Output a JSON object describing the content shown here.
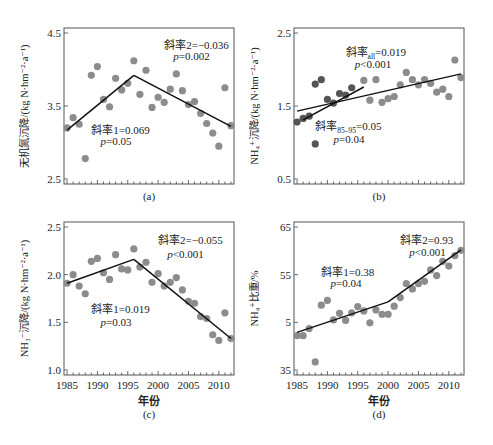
{
  "figure": {
    "x_axis_title": "年份",
    "x_ticks": [
      "1985",
      "1990",
      "1995",
      "2000",
      "2005",
      "2010"
    ]
  },
  "chart_data": [
    {
      "panel": "(a)",
      "type": "scatter",
      "ylabel": "无机氮沉降/(kg N·hm⁻²·a⁻¹)",
      "xlabel": "",
      "ylim": [
        2.5,
        4.5
      ],
      "yticks": [
        "2.5",
        "3.5",
        "4.5"
      ],
      "xlim": [
        1984.5,
        2012.5
      ],
      "grid": false,
      "point_color": "#8c8c8c",
      "x": [
        1985,
        1986,
        1987,
        1988,
        1989,
        1990,
        1991,
        1992,
        1993,
        1994,
        1995,
        1996,
        1997,
        1998,
        1999,
        2000,
        2001,
        2002,
        2003,
        2004,
        2005,
        2006,
        2007,
        2008,
        2009,
        2010,
        2011,
        2012
      ],
      "values": [
        3.2,
        3.34,
        3.25,
        2.78,
        3.92,
        4.04,
        3.59,
        3.49,
        3.88,
        3.72,
        3.81,
        4.12,
        3.66,
        3.99,
        3.48,
        3.62,
        3.55,
        3.73,
        3.94,
        3.71,
        3.52,
        3.56,
        3.4,
        3.26,
        3.13,
        2.95,
        3.75,
        3.23
      ],
      "fit_lines": [
        {
          "x": [
            1985,
            1996
          ],
          "y": [
            3.17,
            3.92
          ]
        },
        {
          "x": [
            1996,
            2012
          ],
          "y": [
            3.92,
            3.22
          ]
        }
      ],
      "annotations": [
        {
          "text": "斜率1=0.069",
          "x": 1989,
          "y": 3.12
        },
        {
          "text": "p=0.05",
          "x": 1990.5,
          "y": 2.97
        },
        {
          "text": "斜率2=−0.036",
          "x": 2001,
          "y": 4.28
        },
        {
          "text": "p=0.002",
          "x": 2002.5,
          "y": 4.13
        }
      ]
    },
    {
      "panel": "(b)",
      "type": "scatter",
      "ylabel": "NH₄⁺沉降/(kg N·hm⁻²·a⁻¹)",
      "xlabel": "",
      "ylim": [
        0.5,
        2.5
      ],
      "yticks": [
        "0.5",
        "1.5",
        "2.5"
      ],
      "xlim": [
        1984.5,
        2012.5
      ],
      "grid": false,
      "series": [
        {
          "name": "1985-1995",
          "color": "#555555",
          "x": [
            1985,
            1986,
            1987,
            1988,
            1989,
            1990,
            1991,
            1992,
            1993,
            1994,
            1995
          ],
          "values": [
            1.28,
            1.33,
            1.36,
            1.8,
            1.86,
            1.59,
            1.54,
            1.67,
            1.65,
            1.75,
            0.98
          ]
        },
        {
          "name": "1996-2012",
          "color": "#8c8c8c",
          "x": [
            1996,
            1997,
            1998,
            1999,
            2000,
            2001,
            2002,
            2003,
            2004,
            2005,
            2006,
            2007,
            2008,
            2009,
            2010,
            2011,
            2012
          ],
          "values": [
            1.85,
            1.58,
            1.86,
            1.55,
            1.6,
            1.63,
            1.79,
            1.96,
            1.86,
            1.79,
            1.86,
            1.81,
            1.69,
            1.73,
            1.63,
            2.13,
            1.89
          ]
        }
      ],
      "outlier_note": "dark point at 1988 value 0.98",
      "fit_lines": [
        {
          "x": [
            1985,
            2012
          ],
          "y": [
            1.43,
            1.94
          ]
        },
        {
          "x": [
            1986,
            1996
          ],
          "y": [
            1.31,
            1.76
          ]
        }
      ],
      "annotations": [
        {
          "text": "斜率",
          "sub": "all",
          "rest": "=0.019",
          "x": 1993,
          "y": 2.18
        },
        {
          "text": "p<0.001",
          "x": 1994.5,
          "y": 2.02
        },
        {
          "text": "斜率",
          "sub": "85–95",
          "rest": "=0.05",
          "x": 1988,
          "y": 1.17
        },
        {
          "text": "p=0.04",
          "x": 1991,
          "y": 0.99
        }
      ]
    },
    {
      "panel": "(c)",
      "type": "scatter",
      "ylabel": "NH₃⁻沉降/(kg N·hm⁻²·a⁻¹)",
      "xlabel": "年份",
      "ylim": [
        1.0,
        2.5
      ],
      "yticks": [
        "1.0",
        "1.5",
        "2.0",
        "2.5"
      ],
      "xlim": [
        1984.5,
        2012.5
      ],
      "grid": false,
      "point_color": "#8c8c8c",
      "x": [
        1985,
        1986,
        1987,
        1988,
        1989,
        1990,
        1991,
        1992,
        1993,
        1994,
        1995,
        1996,
        1997,
        1998,
        1999,
        2000,
        2001,
        2002,
        2003,
        2004,
        2005,
        2006,
        2007,
        2008,
        2009,
        2010,
        2011,
        2012
      ],
      "values": [
        1.91,
        2.0,
        1.88,
        1.8,
        2.14,
        2.17,
        2.02,
        1.95,
        2.21,
        2.06,
        2.05,
        2.27,
        2.08,
        2.13,
        1.92,
        2.01,
        1.88,
        1.92,
        1.97,
        1.84,
        1.72,
        1.7,
        1.56,
        1.54,
        1.37,
        1.31,
        1.6,
        1.33
      ],
      "fit_lines": [
        {
          "x": [
            1985,
            1996
          ],
          "y": [
            1.91,
            2.16
          ]
        },
        {
          "x": [
            1996,
            2012
          ],
          "y": [
            2.16,
            1.33
          ]
        }
      ],
      "annotations": [
        {
          "text": "斜率1=0.019",
          "x": 1989,
          "y": 1.6
        },
        {
          "text": "p=0.03",
          "x": 1990.5,
          "y": 1.46
        },
        {
          "text": "斜率2=−0.055",
          "x": 2000,
          "y": 2.32
        },
        {
          "text": "p<0.001",
          "x": 2001.5,
          "y": 2.18
        }
      ]
    },
    {
      "panel": "(d)",
      "type": "scatter",
      "ylabel": "NH₄⁺比重/%",
      "xlabel": "年份",
      "ylim": [
        35,
        65
      ],
      "yticks": [
        "35",
        "5",
        "55",
        "65"
      ],
      "xlim": [
        1984.5,
        2012.5
      ],
      "grid": false,
      "point_color": "#8c8c8c",
      "x": [
        1985,
        1986,
        1987,
        1988,
        1989,
        1990,
        1991,
        1992,
        1993,
        1994,
        1995,
        1996,
        1997,
        1998,
        1999,
        2000,
        2001,
        2002,
        2003,
        2004,
        2005,
        2006,
        2007,
        2008,
        2009,
        2010,
        2011,
        2012
      ],
      "values": [
        42.2,
        42.2,
        43.7,
        36.7,
        48.6,
        49.6,
        45.5,
        46.9,
        45.4,
        47.0,
        48.3,
        47.4,
        44.9,
        47.6,
        46.7,
        46.7,
        48.4,
        50.2,
        53.1,
        52.0,
        53.1,
        53.6,
        56.0,
        54.8,
        57.8,
        56.8,
        59.0,
        60.1
      ],
      "fit_lines": [
        {
          "x": [
            1985,
            2000
          ],
          "y": [
            42.9,
            49.3
          ]
        },
        {
          "x": [
            2000,
            2012
          ],
          "y": [
            49.3,
            60.2
          ]
        }
      ],
      "annotations": [
        {
          "text": "斜率1=0.38",
          "x": 1989,
          "y": 54.8
        },
        {
          "text": "p=0.04",
          "x": 1990.5,
          "y": 52.4
        },
        {
          "text": "斜率2=0.93",
          "x": 2002,
          "y": 61.5
        },
        {
          "text": "p<0.001",
          "x": 2003.5,
          "y": 59.0
        }
      ]
    }
  ]
}
